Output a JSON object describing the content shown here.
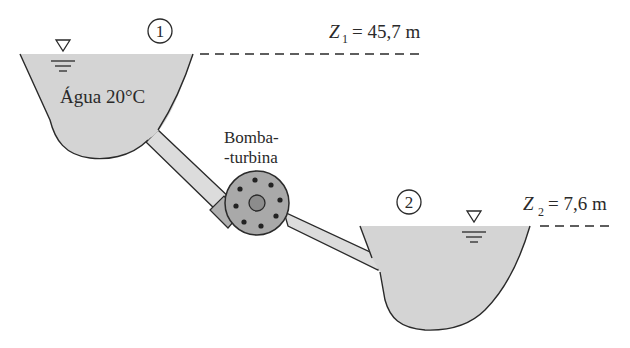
{
  "figure": {
    "reservoir_1": {
      "point_label": "1",
      "fluid_label": "Água 20°C",
      "elevation": {
        "symbol": "Z",
        "subscript": "1",
        "equals": "= 45,7 m"
      }
    },
    "reservoir_2": {
      "point_label": "2",
      "elevation": {
        "symbol": "Z",
        "subscript": "2",
        "equals": "= 7,6 m"
      }
    },
    "machine": {
      "label_line1": "Bomba-",
      "label_line2": "-turbina"
    },
    "colors": {
      "water": "#d4d4d4",
      "outline": "#2a2a2a",
      "pump": "#a9a9a9",
      "hub": "#8c8c8c",
      "pipe": "#dcdcdc"
    }
  }
}
